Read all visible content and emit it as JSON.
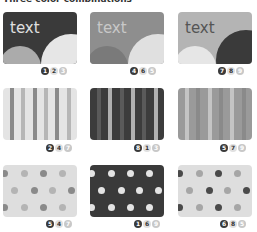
{
  "title": "Three color combinations",
  "palette": {
    "dark": "#3a3a3a",
    "mid": "#8a8a8a",
    "midlight": "#ababab",
    "light": "#d6d6d6",
    "pale": "#e6e6e6"
  },
  "cards": [
    {
      "kind": "text",
      "label": "text",
      "badges": [
        "1",
        "2",
        "3"
      ]
    },
    {
      "kind": "text",
      "label": "text",
      "badges": [
        "4",
        "6",
        "5"
      ]
    },
    {
      "kind": "text",
      "label": "text",
      "badges": [
        "7",
        "8",
        "9"
      ]
    },
    {
      "kind": "stripes",
      "badges": [
        "2",
        "4",
        "7"
      ]
    },
    {
      "kind": "stripes",
      "badges": [
        "8",
        "1",
        "3"
      ]
    },
    {
      "kind": "stripes",
      "badges": [
        "5",
        "7",
        "9"
      ]
    },
    {
      "kind": "dots",
      "badges": [
        "5",
        "4",
        "7"
      ]
    },
    {
      "kind": "dots",
      "badges": [
        "1",
        "6",
        "9"
      ]
    },
    {
      "kind": "dots",
      "badges": [
        "6",
        "8",
        "5"
      ]
    }
  ]
}
